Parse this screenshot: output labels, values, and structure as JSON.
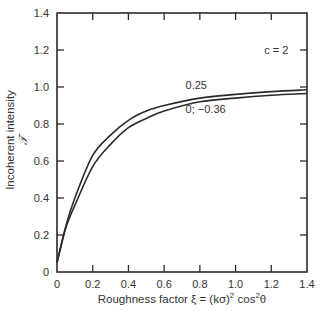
{
  "chart_data": {
    "type": "line",
    "title": "",
    "xlabel": "Roughness factor ξ = (kσ)² cos²θ",
    "xlabel_parts": {
      "main": "Roughness factor ξ = (kσ)",
      "sup1": "2",
      "mid": " cos",
      "sup2": "2",
      "end": "θ"
    },
    "ylabel": "Incoherent intensity",
    "ylabel_symbol": "𝒯",
    "xlim": [
      0,
      1.4
    ],
    "ylim": [
      0,
      1.4
    ],
    "xticks": [
      0,
      0.2,
      0.4,
      0.6,
      0.8,
      1.0,
      1.2,
      1.4
    ],
    "xtick_labels": [
      "0",
      "0.2",
      "0.4",
      "0.6",
      "0.8",
      "1.0",
      "1.2",
      "1.4"
    ],
    "yticks": [
      0,
      0.2,
      0.4,
      0.6,
      0.8,
      1.0,
      1.2,
      1.4
    ],
    "ytick_labels": [
      "0",
      "0.2",
      "0.4",
      "0.6",
      "0.8",
      "1.0",
      "1.2",
      "1.4"
    ],
    "grid": false,
    "legend": "none (inline curve labels)",
    "annotations": [
      {
        "text": "c = 2",
        "x": 1.16,
        "y": 1.18
      },
      {
        "text": "0.25",
        "x": 0.72,
        "y": 0.99
      },
      {
        "text": "0; −0.36",
        "x": 0.72,
        "y": 0.86
      }
    ],
    "x": [
      0,
      0.05,
      0.1,
      0.2,
      0.3,
      0.4,
      0.5,
      0.6,
      0.8,
      1.0,
      1.2,
      1.4
    ],
    "series": [
      {
        "name": "0.25",
        "values": [
          0.05,
          0.25,
          0.4,
          0.63,
          0.74,
          0.82,
          0.87,
          0.9,
          0.94,
          0.96,
          0.975,
          0.985
        ]
      },
      {
        "name": "0; −0.36",
        "values": [
          0.05,
          0.24,
          0.36,
          0.57,
          0.69,
          0.78,
          0.83,
          0.87,
          0.92,
          0.94,
          0.955,
          0.965
        ]
      }
    ]
  },
  "style": {
    "line_color": "#2a2a2a",
    "frame_color": "#2a2a2a"
  }
}
